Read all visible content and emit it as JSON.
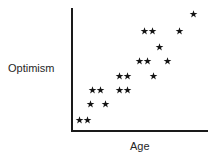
{
  "chart_data": {
    "type": "scatter",
    "title": "",
    "subtitle": "",
    "xlabel": "Age",
    "ylabel": "Optimism",
    "grid": false,
    "legend": null,
    "legend_position": "none",
    "marker": "star-asterisk",
    "marker_color": "#141414",
    "axis_color": "#1a1a1a",
    "xlim": [
      0,
      10
    ],
    "ylim": [
      0,
      10
    ],
    "xticks": [],
    "yticks": [],
    "xtick_labels": [],
    "ytick_labels": [],
    "annotations": [],
    "n_points": 19,
    "points": [
      {
        "x": 0.55,
        "y": 0.85
      },
      {
        "x": 1.15,
        "y": 0.85
      },
      {
        "x": 1.35,
        "y": 2.15
      },
      {
        "x": 2.5,
        "y": 2.15
      },
      {
        "x": 1.55,
        "y": 3.25
      },
      {
        "x": 2.15,
        "y": 3.25
      },
      {
        "x": 3.55,
        "y": 3.1
      },
      {
        "x": 4.15,
        "y": 3.1
      },
      {
        "x": 3.55,
        "y": 4.2
      },
      {
        "x": 4.15,
        "y": 4.2
      },
      {
        "x": 6.1,
        "y": 4.2
      },
      {
        "x": 5.1,
        "y": 5.35
      },
      {
        "x": 5.7,
        "y": 5.35
      },
      {
        "x": 7.1,
        "y": 5.3
      },
      {
        "x": 6.6,
        "y": 6.45
      },
      {
        "x": 5.45,
        "y": 7.7
      },
      {
        "x": 7.95,
        "y": 7.7
      },
      {
        "x": 9.05,
        "y": 9.1
      },
      {
        "x": 6.05,
        "y": 7.72
      }
    ],
    "pixel_points": [
      {
        "x": 79,
        "y": 120
      },
      {
        "x": 87,
        "y": 120
      },
      {
        "x": 90,
        "y": 104
      },
      {
        "x": 105,
        "y": 104
      },
      {
        "x": 92,
        "y": 90
      },
      {
        "x": 100,
        "y": 90
      },
      {
        "x": 119,
        "y": 90
      },
      {
        "x": 127,
        "y": 90
      },
      {
        "x": 119,
        "y": 76
      },
      {
        "x": 127,
        "y": 76
      },
      {
        "x": 153,
        "y": 76
      },
      {
        "x": 139,
        "y": 61
      },
      {
        "x": 147,
        "y": 61
      },
      {
        "x": 167,
        "y": 61
      },
      {
        "x": 159,
        "y": 47
      },
      {
        "x": 144,
        "y": 31
      },
      {
        "x": 179,
        "y": 31
      },
      {
        "x": 193,
        "y": 14
      },
      {
        "x": 152,
        "y": 31
      }
    ]
  },
  "labels": {
    "y_axis": "Optimism",
    "x_axis": "Age"
  }
}
